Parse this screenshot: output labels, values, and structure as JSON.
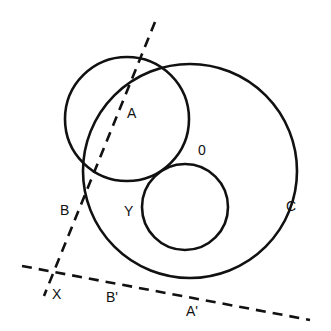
{
  "colors": {
    "stroke": "#111111",
    "background": "#ffffff"
  },
  "circles": [
    {
      "id": "circle-ab",
      "cx": 127,
      "cy": 119,
      "r": 62
    },
    {
      "id": "circle-c",
      "cx": 190,
      "cy": 171,
      "r": 107
    },
    {
      "id": "circle-small",
      "cx": 185,
      "cy": 207,
      "r": 43
    }
  ],
  "lines": [
    {
      "id": "line-ab",
      "x1": 155,
      "y1": 22,
      "x2": 44,
      "y2": 296,
      "dashed": true
    },
    {
      "id": "line-x",
      "x1": 22,
      "y1": 266,
      "x2": 310,
      "y2": 320,
      "dashed": true
    }
  ],
  "labels": {
    "A": {
      "text": "A",
      "x": 127,
      "y": 118
    },
    "B": {
      "text": "B",
      "x": 60,
      "y": 215
    },
    "O": {
      "text": "0",
      "x": 198,
      "y": 155
    },
    "Y": {
      "text": "Y",
      "x": 124,
      "y": 216
    },
    "C": {
      "text": "C",
      "x": 286,
      "y": 211
    },
    "X": {
      "text": "X",
      "x": 52,
      "y": 299
    },
    "B_prime": {
      "text": "B'",
      "x": 106,
      "y": 302
    },
    "A_prime": {
      "text": "A'",
      "x": 186,
      "y": 316
    }
  }
}
